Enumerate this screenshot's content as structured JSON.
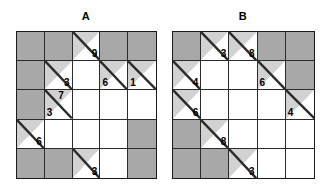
{
  "figure": {
    "panels": [
      {
        "label": "A",
        "name": "grid-a",
        "rows": 5,
        "cols": 5,
        "cells": [
          {
            "type": "shaded",
            "clue_upper": "",
            "clue_lower": ""
          },
          {
            "type": "shaded",
            "clue_upper": "",
            "clue_lower": ""
          },
          {
            "type": "diag",
            "clue_upper": "9",
            "clue_lower": ""
          },
          {
            "type": "shaded",
            "clue_upper": "",
            "clue_lower": ""
          },
          {
            "type": "shaded",
            "clue_upper": "",
            "clue_lower": ""
          },
          {
            "type": "shaded",
            "clue_upper": "",
            "clue_lower": ""
          },
          {
            "type": "diag",
            "clue_upper": "3",
            "clue_lower": ""
          },
          {
            "type": "white",
            "clue_upper": "",
            "clue_lower": ""
          },
          {
            "type": "diag",
            "clue_upper": "",
            "clue_lower": "6"
          },
          {
            "type": "diag",
            "clue_upper": "",
            "clue_lower": "1"
          },
          {
            "type": "shaded",
            "clue_upper": "",
            "clue_lower": ""
          },
          {
            "type": "diag",
            "clue_upper": "7",
            "clue_lower": "3"
          },
          {
            "type": "white",
            "clue_upper": "",
            "clue_lower": ""
          },
          {
            "type": "white",
            "clue_upper": "",
            "clue_lower": ""
          },
          {
            "type": "white",
            "clue_upper": "",
            "clue_lower": ""
          },
          {
            "type": "diag",
            "clue_upper": "6",
            "clue_lower": ""
          },
          {
            "type": "white",
            "clue_upper": "",
            "clue_lower": ""
          },
          {
            "type": "white",
            "clue_upper": "",
            "clue_lower": ""
          },
          {
            "type": "white",
            "clue_upper": "",
            "clue_lower": ""
          },
          {
            "type": "shaded",
            "clue_upper": "",
            "clue_lower": ""
          },
          {
            "type": "shaded",
            "clue_upper": "",
            "clue_lower": ""
          },
          {
            "type": "shaded",
            "clue_upper": "",
            "clue_lower": ""
          },
          {
            "type": "diag",
            "clue_upper": "3",
            "clue_lower": ""
          },
          {
            "type": "white",
            "clue_upper": "",
            "clue_lower": ""
          },
          {
            "type": "shaded",
            "clue_upper": "",
            "clue_lower": ""
          }
        ]
      },
      {
        "label": "B",
        "name": "grid-b",
        "rows": 5,
        "cols": 5,
        "cells": [
          {
            "type": "shaded",
            "clue_upper": "",
            "clue_lower": ""
          },
          {
            "type": "diag",
            "clue_upper": "3",
            "clue_lower": ""
          },
          {
            "type": "diag",
            "clue_upper": "8",
            "clue_lower": ""
          },
          {
            "type": "shaded",
            "clue_upper": "",
            "clue_lower": ""
          },
          {
            "type": "shaded",
            "clue_upper": "",
            "clue_lower": ""
          },
          {
            "type": "diag",
            "clue_upper": "4",
            "clue_lower": ""
          },
          {
            "type": "white",
            "clue_upper": "",
            "clue_lower": ""
          },
          {
            "type": "white",
            "clue_upper": "",
            "clue_lower": ""
          },
          {
            "type": "diag",
            "clue_upper": "",
            "clue_lower": "6"
          },
          {
            "type": "shaded",
            "clue_upper": "",
            "clue_lower": ""
          },
          {
            "type": "diag",
            "clue_upper": "6",
            "clue_lower": ""
          },
          {
            "type": "white",
            "clue_upper": "",
            "clue_lower": ""
          },
          {
            "type": "white",
            "clue_upper": "",
            "clue_lower": ""
          },
          {
            "type": "white",
            "clue_upper": "",
            "clue_lower": ""
          },
          {
            "type": "diag",
            "clue_upper": "",
            "clue_lower": "4"
          },
          {
            "type": "shaded",
            "clue_upper": "",
            "clue_lower": ""
          },
          {
            "type": "diag",
            "clue_upper": "8",
            "clue_lower": ""
          },
          {
            "type": "white",
            "clue_upper": "",
            "clue_lower": ""
          },
          {
            "type": "white",
            "clue_upper": "",
            "clue_lower": ""
          },
          {
            "type": "white",
            "clue_upper": "",
            "clue_lower": ""
          },
          {
            "type": "shaded",
            "clue_upper": "",
            "clue_lower": ""
          },
          {
            "type": "shaded",
            "clue_upper": "",
            "clue_lower": ""
          },
          {
            "type": "diag",
            "clue_upper": "3",
            "clue_lower": ""
          },
          {
            "type": "white",
            "clue_upper": "",
            "clue_lower": ""
          },
          {
            "type": "white",
            "clue_upper": "",
            "clue_lower": ""
          }
        ]
      }
    ],
    "colors": {
      "shaded": "#a8a8a8",
      "half_shaded": "#d2d2d2",
      "empty": "#ffffff",
      "line": "#2b2b2b",
      "text": "#000000"
    }
  }
}
